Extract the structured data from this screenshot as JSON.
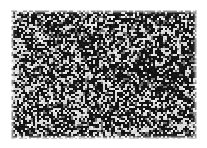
{
  "page": {
    "width": 207,
    "height": 148,
    "background_color": "#ffffff",
    "content_kind": "scanned-speckle-micrograph",
    "has_text": false,
    "has_axes": false,
    "has_legend": false,
    "has_border_rule": false
  },
  "plate": {
    "name": "speckle-field",
    "left": 11,
    "top": 10,
    "width": 186,
    "height": 129,
    "base_color": "#d9d9d9",
    "speckle_color": "#141414",
    "mid_color": "#6e6e6e",
    "highlight_color": "#f2f2f2",
    "black_coverage_pct": 55,
    "grain_size_px": 1.6,
    "edge_treatment": "feathered",
    "density_notes": {
      "overall": "uniform fine random binary speckle",
      "lighter_region": "mid-left",
      "denser_region": "upper-right"
    }
  },
  "margins": {
    "left": 11,
    "top": 10,
    "right": 10,
    "bottom": 9,
    "color": "#ffffff"
  }
}
